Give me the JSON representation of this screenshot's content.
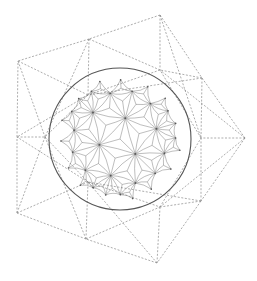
{
  "figure": {
    "colors": {
      "background": "#ffffff",
      "dashed_lines": "#8a8a8a",
      "disk_boundary": "#555555",
      "tiling_lines": "#6e6e6e"
    }
  },
  "disk": {
    "cx": 120,
    "cy": 139,
    "r": 71,
    "tiling": {
      "p": 3,
      "q": 7,
      "depth": 4
    }
  },
  "wireframe": {
    "vertices": {
      "A": [
        160,
        15
      ],
      "B": [
        89,
        39
      ],
      "C": [
        18,
        61
      ],
      "D": [
        202,
        78
      ],
      "E": [
        245,
        138
      ],
      "F": [
        201,
        201
      ],
      "G": [
        157,
        263
      ],
      "H": [
        86,
        239
      ],
      "I": [
        17,
        213
      ],
      "J": [
        17,
        137
      ],
      "K": [
        160,
        70
      ],
      "L": [
        88,
        95
      ],
      "M": [
        160,
        207
      ],
      "N": [
        88,
        182
      ],
      "O": [
        45,
        137
      ],
      "P": [
        201,
        138
      ]
    },
    "edges": [
      [
        "A",
        "B"
      ],
      [
        "B",
        "C"
      ],
      [
        "A",
        "D"
      ],
      [
        "D",
        "E"
      ],
      [
        "E",
        "F"
      ],
      [
        "F",
        "G"
      ],
      [
        "G",
        "H"
      ],
      [
        "H",
        "I"
      ],
      [
        "I",
        "J"
      ],
      [
        "J",
        "C"
      ],
      [
        "A",
        "K"
      ],
      [
        "B",
        "K"
      ],
      [
        "B",
        "L"
      ],
      [
        "C",
        "L"
      ],
      [
        "D",
        "K"
      ],
      [
        "D",
        "P"
      ],
      [
        "E",
        "P"
      ],
      [
        "F",
        "P"
      ],
      [
        "F",
        "M"
      ],
      [
        "G",
        "M"
      ],
      [
        "H",
        "M"
      ],
      [
        "H",
        "N"
      ],
      [
        "I",
        "N"
      ],
      [
        "J",
        "O"
      ],
      [
        "C",
        "O"
      ],
      [
        "I",
        "O"
      ],
      [
        "A",
        "P"
      ],
      [
        "D",
        "L"
      ],
      [
        "E",
        "K"
      ],
      [
        "E",
        "M"
      ],
      [
        "F",
        "N"
      ],
      [
        "G",
        "N"
      ],
      [
        "H",
        "O"
      ],
      [
        "B",
        "O"
      ],
      [
        "L",
        "J"
      ],
      [
        "N",
        "J"
      ],
      [
        "K",
        "L"
      ],
      [
        "L",
        "O"
      ],
      [
        "O",
        "N"
      ],
      [
        "N",
        "M"
      ],
      [
        "M",
        "P"
      ],
      [
        "P",
        "K"
      ]
    ]
  }
}
